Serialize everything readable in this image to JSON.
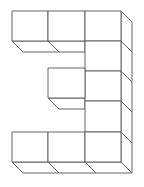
{
  "figure": {
    "stroke_color": "#555555",
    "fill_color": "#ffffff",
    "cube_count": 11,
    "rows": [
      {
        "row": 1,
        "cells": [
          1,
          1,
          1
        ]
      },
      {
        "row": 2,
        "cells": [
          0,
          0,
          1
        ]
      },
      {
        "row": 3,
        "cells": [
          0,
          1,
          1
        ]
      },
      {
        "row": 4,
        "cells": [
          0,
          0,
          1
        ]
      },
      {
        "row": 5,
        "cells": [
          1,
          1,
          1
        ]
      }
    ]
  }
}
